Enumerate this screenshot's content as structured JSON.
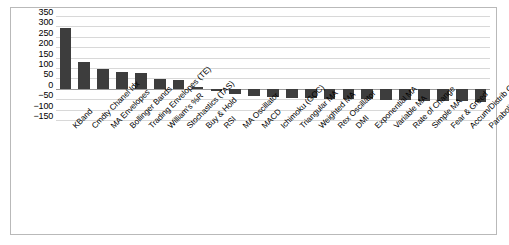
{
  "chart_data": {
    "type": "bar",
    "title": "",
    "xlabel": "",
    "ylabel": "",
    "ylim": [
      -150,
      350
    ],
    "yticks": [
      350,
      300,
      250,
      200,
      150,
      100,
      50,
      0,
      -50,
      -100,
      -150
    ],
    "ytick_labels": [
      "350",
      "300",
      "250",
      "200",
      "150",
      "100",
      "50",
      "0",
      "−50",
      "−100",
      "−150"
    ],
    "grid": true,
    "legend": "none",
    "bar_color": "#3d3d3d",
    "categories": [
      "KBand",
      "Cmdty Chanel Idx",
      "MA Envelopes",
      "Bollinger Bands",
      "Trading Envelopes (TE)",
      "William's %R",
      "Stochastics (TAS)",
      "Buy & Hold",
      "RSI",
      "MA Oscillator",
      "MACD",
      "Ichimoku (GOC)",
      "Triangular MA",
      "Weighted MA",
      "Rex Oscillator",
      "DMI",
      "Exponential MA",
      "Variable MA",
      "Rate of Change",
      "Simple MA",
      "Fear & Greed",
      "Accum/Distrib Osc",
      "Parabolic (PTPS)"
    ],
    "values": [
      290,
      131,
      96,
      79,
      78,
      49,
      40,
      11,
      -9,
      -26,
      -35,
      -41,
      -43,
      -45,
      -47,
      -49,
      -51,
      -53,
      -55,
      -57,
      -58,
      -60,
      -62
    ]
  }
}
